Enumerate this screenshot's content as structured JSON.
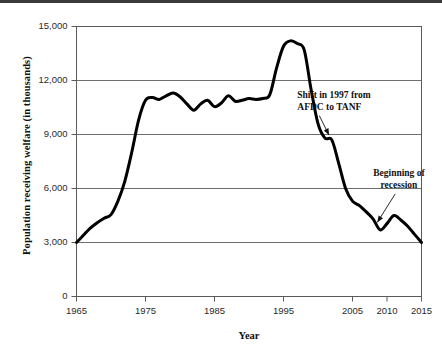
{
  "figure": {
    "top_rule_color": "#3b3b3b",
    "background": "#ffffff"
  },
  "chart_data": {
    "type": "line",
    "title": "",
    "xlabel": "Year",
    "ylabel": "Population receiving welfare (in thousands)",
    "xlim": [
      1965,
      2015
    ],
    "ylim": [
      0,
      15000
    ],
    "grid": true,
    "grid_axis": "y",
    "legend": "none",
    "line_color": "#000000",
    "line_width": 3,
    "xticks": [
      1965,
      1975,
      1985,
      1995,
      2005,
      2010,
      2015
    ],
    "xtick_labels": [
      "1965",
      "1975",
      "1985",
      "1995",
      "2005",
      "2010",
      "2015"
    ],
    "yticks": [
      0,
      3000,
      6000,
      9000,
      12000,
      15000
    ],
    "ytick_labels": [
      "0",
      "3,000",
      "6,000",
      "9,000",
      "12,000",
      "15,000"
    ],
    "series": [
      {
        "name": "Population receiving welfare",
        "x": [
          1965,
          1966,
          1967,
          1968,
          1969,
          1970,
          1971,
          1972,
          1973,
          1974,
          1975,
          1976,
          1977,
          1978,
          1979,
          1980,
          1981,
          1982,
          1983,
          1984,
          1985,
          1986,
          1987,
          1988,
          1989,
          1990,
          1991,
          1992,
          1993,
          1994,
          1995,
          1996,
          1997,
          1998,
          1999,
          2000,
          2001,
          2002,
          2003,
          2004,
          2005,
          2006,
          2007,
          2008,
          2009,
          2010,
          2011,
          2012,
          2013,
          2014,
          2015
        ],
        "values": [
          3000,
          3400,
          3800,
          4100,
          4350,
          4550,
          5300,
          6400,
          8000,
          9800,
          10900,
          11050,
          10950,
          11150,
          11300,
          11100,
          10700,
          10350,
          10700,
          10900,
          10550,
          10750,
          11150,
          10850,
          10900,
          11000,
          10950,
          11000,
          11200,
          12700,
          13900,
          14200,
          14050,
          13700,
          11500,
          9600,
          8800,
          8700,
          7400,
          6000,
          5300,
          5050,
          4700,
          4300,
          3700,
          4050,
          4500,
          4250,
          3900,
          3450,
          3000
        ]
      }
    ],
    "annotations": [
      {
        "id": "shift-1997",
        "text_lines": [
          "Shift in 1997 from",
          "AFDC to TANF"
        ],
        "text_x": 1997.0,
        "text_y": 11550,
        "arrow_to_x": 2001.6,
        "arrow_to_y": 8800
      },
      {
        "id": "beginning-of-recession",
        "text_lines": [
          "Beginning of",
          "recession"
        ],
        "text_x": 2008.0,
        "text_y": 7200,
        "arrow_to_x": 2008.6,
        "arrow_to_y": 3950
      }
    ]
  }
}
